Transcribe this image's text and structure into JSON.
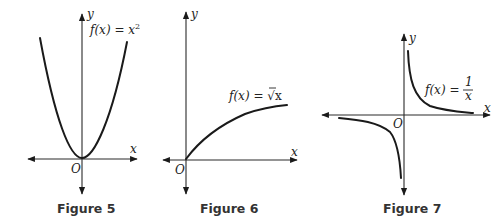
{
  "figures": [
    {
      "caption": "Figure 5",
      "function_label": "f(x) = x",
      "function_exponent": "2",
      "x_axis_label": "x",
      "y_axis_label": "y",
      "origin_label": "O",
      "curve": "parabola"
    },
    {
      "caption": "Figure 6",
      "function_label": "f(x) = ",
      "function_radical": "√x",
      "x_axis_label": "x",
      "y_axis_label": "y",
      "origin_label": "O",
      "curve": "square-root"
    },
    {
      "caption": "Figure 7",
      "function_label": "f(x) = ",
      "function_numerator": "1",
      "function_denominator": "x",
      "x_axis_label": "x",
      "y_axis_label": "y",
      "origin_label": "O",
      "curve": "reciprocal"
    }
  ],
  "colors": {
    "ink": "#1a1a1a",
    "background": "#ffffff"
  }
}
